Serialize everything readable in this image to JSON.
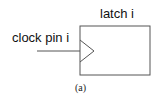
{
  "diagram": {
    "latch_label": "latch i",
    "clock_label": "clock pin i",
    "caption": "(a)",
    "colors": {
      "stroke": "#555555",
      "text": "#111111"
    }
  }
}
